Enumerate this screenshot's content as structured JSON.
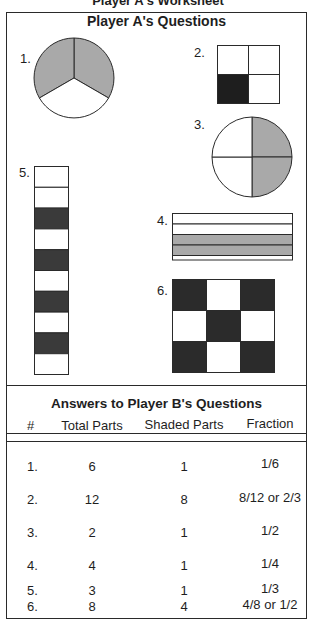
{
  "worksheet": {
    "title": "Player A's Worksheet"
  },
  "questions_section": {
    "title": "Player A's Questions",
    "colors": {
      "light_shade": "#a9a9a9",
      "dark_shade": "#2b2b2b",
      "line": "#2a2a2a",
      "blank": "#ffffff"
    },
    "questions": [
      {
        "number": "1.",
        "shape": "circle",
        "total_parts": 3,
        "shaded_parts": 2,
        "shade": "light"
      },
      {
        "number": "2.",
        "shape": "square-grid-2x2",
        "total_parts": 4,
        "shaded_parts": 1,
        "shade": "dark"
      },
      {
        "number": "3.",
        "shape": "circle",
        "total_parts": 4,
        "shaded_parts": 2,
        "shade": "light"
      },
      {
        "number": "4.",
        "shape": "horizontal-strips",
        "total_parts": 4,
        "shaded_parts": 2,
        "shade": "light"
      },
      {
        "number": "5.",
        "shape": "vertical-strip",
        "total_parts": 10,
        "shaded_parts": 4,
        "shade": "dark"
      },
      {
        "number": "6.",
        "shape": "grid-3x3",
        "total_parts": 9,
        "shaded_parts": 5,
        "shade": "dark"
      }
    ]
  },
  "answers_section": {
    "title": "Answers to Player B's Questions",
    "columns": [
      "#",
      "Total Parts",
      "Shaded Parts",
      "Fraction"
    ],
    "rows": [
      {
        "num": "1.",
        "total": "6",
        "shaded": "1",
        "fraction": "1/6"
      },
      {
        "num": "2.",
        "total": "12",
        "shaded": "8",
        "fraction": "8/12 or 2/3"
      },
      {
        "num": "3.",
        "total": "2",
        "shaded": "1",
        "fraction": "1/2"
      },
      {
        "num": "4.",
        "total": "4",
        "shaded": "1",
        "fraction": "1/4"
      },
      {
        "num": "5.",
        "total": "3",
        "shaded": "1",
        "fraction": "1/3"
      },
      {
        "num": "6.",
        "total": "8",
        "shaded": "4",
        "fraction": "4/8 or 1/2"
      }
    ]
  }
}
